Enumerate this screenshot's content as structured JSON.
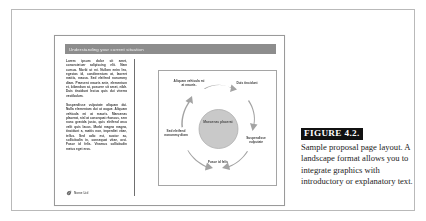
{
  "figure": {
    "label": "FIGURE 4.2.",
    "caption": "Sample proposal page layout. A landscape format allows you to integrate graphics with introductory or explanatory text."
  },
  "slide": {
    "header_title": "Understanding your current situation",
    "paragraphs": [
      "Lorem ipsum dolor sit amet, consectetuer adipiscing elit. Nam cursus. Morbi ut mi. Nullam enim leo, egestas id, condimentum at, laoreet mattis, massa. Sed eleifend nonummy diam. Praesent mauris ante, elementum et, bibendum at, posuere sit amet, nibh. Duis tincidunt lectus quis dui viverra vestibulum.",
      "Suspendisse vulputate aliquam dui. Nulla elementum dui ut augue. Aliquam vehicula mi at mauris. Maecenas placerat, nisl at consequat rhoncus, sem nunc gravida justo, quis eleifend arcu velit quis lacus. Morbi magna magna, tincidunt a, mattis non, imperdiet vitae, tellus. Sed odio est, auctor ac, sollicitudin in, consequat vitae, orci. Fusce id felis. Vivamus sollicitudin metus eget eros."
    ],
    "footer_text": "Nome Ltd",
    "footer_logo_icon": "leaf-logo-icon"
  },
  "diagram": {
    "type": "cycle",
    "center_label": "Maecenas placerat",
    "nodes": [
      {
        "id": "top-left",
        "label": "Aliquam vehicula mi at mauris."
      },
      {
        "id": "top-right",
        "label": "Duis tincidunt"
      },
      {
        "id": "right",
        "label": "Suspendisse vulputate"
      },
      {
        "id": "bottom",
        "label": "Fusce id felis"
      },
      {
        "id": "left",
        "label": "Sed eleifend nonummy diam"
      }
    ],
    "arrow_color": "#9a9a9a",
    "center_fill": "#c9c9c9"
  },
  "colors": {
    "header_bar": "#8d8d8d",
    "figure_label_bg": "#111111",
    "frame_border": "#b9b9b9",
    "divider": "#6f6f6f"
  }
}
